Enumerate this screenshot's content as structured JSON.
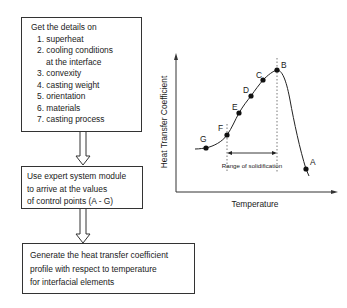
{
  "flowchart": {
    "step1": {
      "heading": "Get the details on",
      "items": [
        "1. superheat",
        "2. cooling conditions",
        "at the interface",
        "3. convexity",
        "4. casting weight",
        "5. orientation",
        "6. materials",
        "7. casting process"
      ]
    },
    "step2": {
      "lines": [
        "Use expert system module",
        "to arrive at the values",
        "of control points (A - G)"
      ]
    },
    "step3": {
      "lines": [
        "Generate the heat transfer coefficient",
        "profile with respect to temperature",
        "for interfacial elements"
      ]
    }
  },
  "graph": {
    "ylabel": "Heat Transfer Coefficient",
    "xlabel": "Temperature",
    "range_label": "Range of solidification",
    "points": {
      "A": "A",
      "B": "B",
      "C": "C",
      "D": "D",
      "E": "E",
      "F": "F",
      "G": "G"
    }
  }
}
